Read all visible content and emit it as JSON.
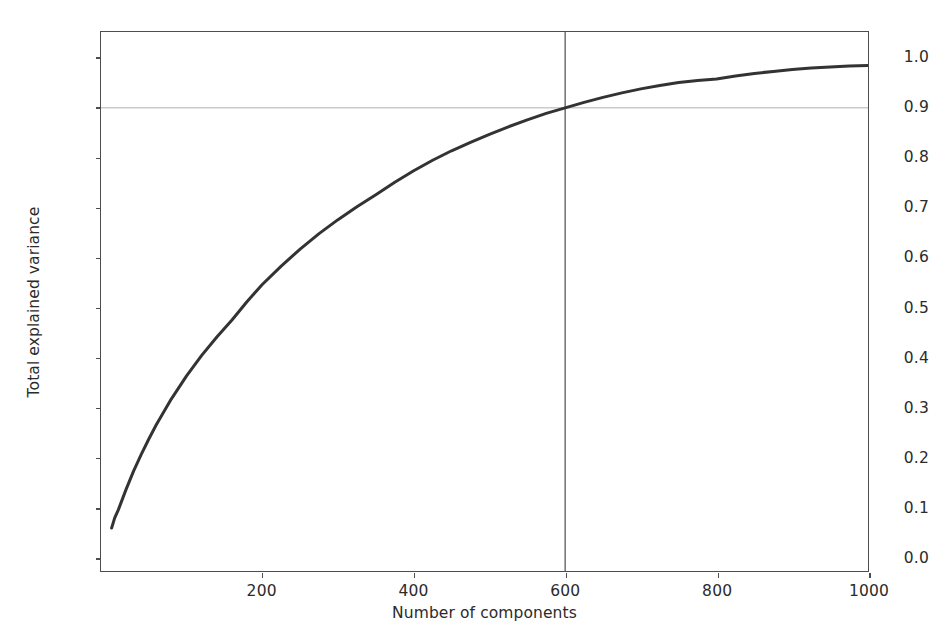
{
  "chart_data": {
    "type": "line",
    "title": "",
    "xlabel": "Number of components",
    "ylabel": "Total explained variance",
    "xlim": [
      -13,
      1000
    ],
    "ylim": [
      -0.028,
      1.052
    ],
    "xticks": [
      200,
      400,
      600,
      800,
      1000
    ],
    "xtick_labels": [
      "200",
      "400",
      "600",
      "800",
      "1000"
    ],
    "yticks": [
      0.0,
      0.1,
      0.2,
      0.3,
      0.4,
      0.5,
      0.6,
      0.7,
      0.8,
      0.9,
      1.0
    ],
    "ytick_labels": [
      "0.0",
      "0.1",
      "0.2",
      "0.3",
      "0.4",
      "0.5",
      "0.6",
      "0.7",
      "0.8",
      "0.9",
      "1.0"
    ],
    "grid": false,
    "legend": null,
    "line_color": "#333333",
    "reference_line_color": "#4d4d4d",
    "series": [
      {
        "name": "Cumulative explained variance",
        "x": [
          1,
          5,
          10,
          20,
          30,
          40,
          50,
          60,
          80,
          100,
          120,
          140,
          160,
          180,
          200,
          225,
          250,
          275,
          300,
          325,
          350,
          375,
          400,
          425,
          450,
          475,
          500,
          525,
          550,
          575,
          600,
          625,
          650,
          675,
          700,
          725,
          750,
          775,
          800,
          825,
          850,
          875,
          900,
          925,
          950,
          975,
          1000
        ],
        "y": [
          0.058,
          0.078,
          0.095,
          0.135,
          0.172,
          0.205,
          0.236,
          0.265,
          0.317,
          0.363,
          0.404,
          0.441,
          0.475,
          0.512,
          0.546,
          0.583,
          0.617,
          0.648,
          0.676,
          0.702,
          0.726,
          0.751,
          0.774,
          0.795,
          0.814,
          0.831,
          0.847,
          0.862,
          0.876,
          0.889,
          0.9,
          0.911,
          0.921,
          0.93,
          0.938,
          0.945,
          0.951,
          0.955,
          0.958,
          0.964,
          0.969,
          0.973,
          0.977,
          0.98,
          0.982,
          0.984,
          0.985
        ]
      }
    ],
    "annotations": [
      {
        "name": "variance-threshold-line",
        "kind": "hline",
        "value": 0.9,
        "label": "0.9 explained variance threshold",
        "style": "solid-thin",
        "color": "#b0b0b0"
      },
      {
        "name": "component-count-line",
        "kind": "vline",
        "value": 600,
        "label": "600 components",
        "style": "solid",
        "color": "#4d4d4d"
      }
    ],
    "intersection": {
      "x": 600,
      "y": 0.9,
      "label": "600 components explain 90% of variance"
    }
  }
}
